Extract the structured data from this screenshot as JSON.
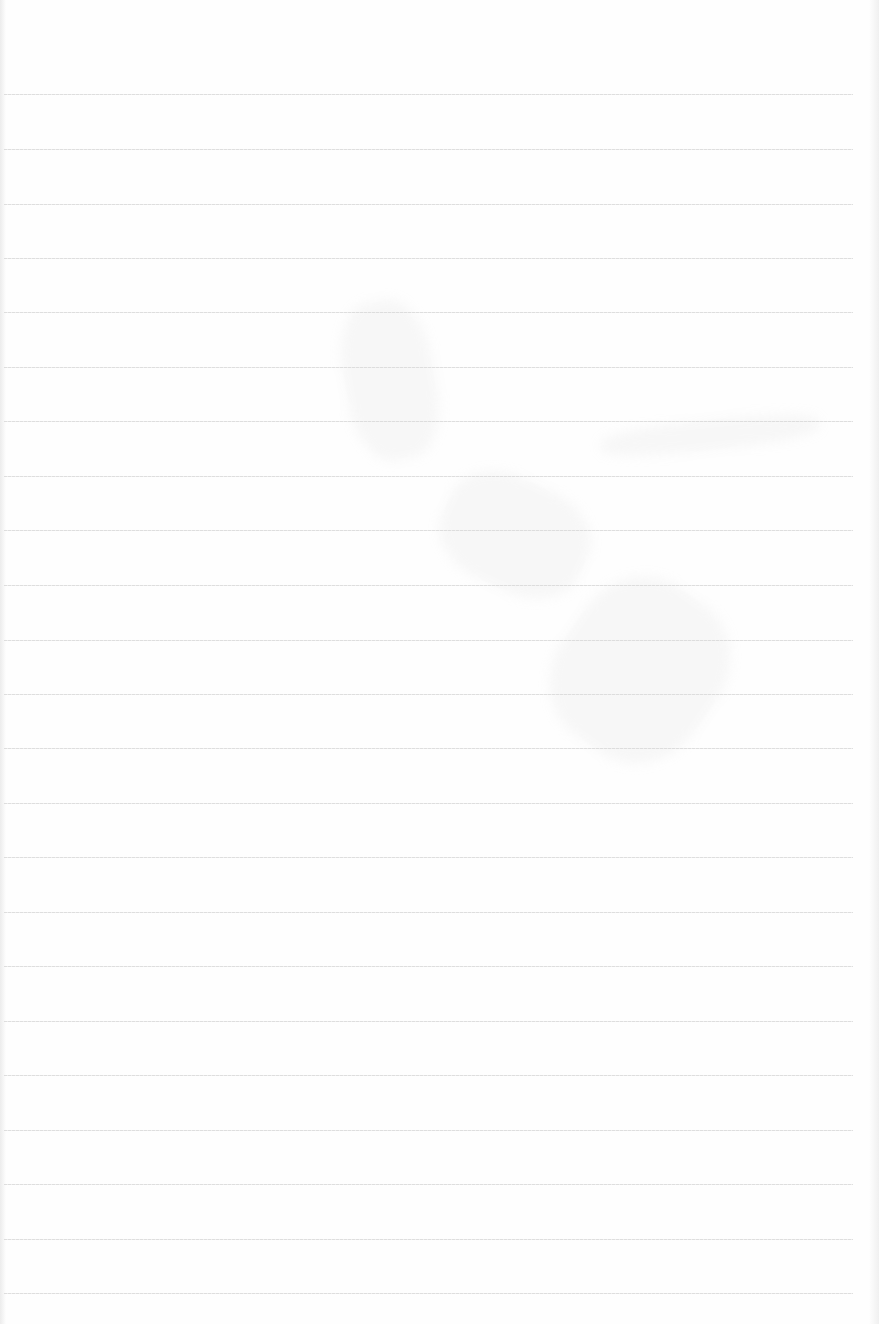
{
  "page": {
    "type": "ruled-notebook-paper",
    "content": "",
    "background_color": "#fefefe",
    "rule_color": "#d9d9d9",
    "rule_count": 23,
    "rule_left_px": 4,
    "rule_width_px": 849,
    "rule_positions_px": [
      94,
      149,
      204,
      258,
      312,
      367,
      421,
      476,
      530,
      585,
      640,
      694,
      748,
      803,
      857,
      912,
      966,
      1021,
      1075,
      1130,
      1184,
      1239,
      1293
    ]
  }
}
